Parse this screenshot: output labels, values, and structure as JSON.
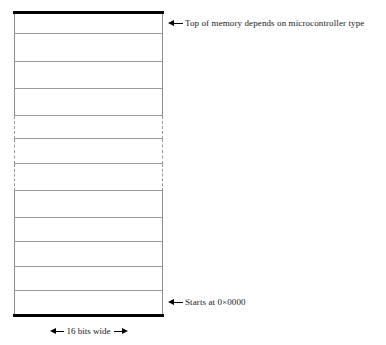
{
  "diagram": {
    "kind": "memory-map",
    "title_visible": false,
    "box": {
      "left_px": 14,
      "top_px": 11,
      "width_px": 149,
      "height_px": 306,
      "top_cap_color": "#000000",
      "bottom_cap_color": "#000000",
      "cell_rule_color": "#9a9a9a",
      "side_border_color": "#8c8c8c",
      "dashed_border_color": "#9a9a9a",
      "fill_color": "#ffffff"
    },
    "cells": [
      {
        "index": 0,
        "top_px": 0,
        "height_px": 20,
        "style": "solid",
        "rule_below": true,
        "label": ""
      },
      {
        "index": 1,
        "top_px": 20,
        "height_px": 28,
        "style": "solid",
        "rule_below": true,
        "label": ""
      },
      {
        "index": 2,
        "top_px": 48,
        "height_px": 27,
        "style": "solid",
        "rule_below": true,
        "label": ""
      },
      {
        "index": 3,
        "top_px": 75,
        "height_px": 27,
        "style": "solid",
        "rule_below": true,
        "label": ""
      },
      {
        "index": 4,
        "top_px": 102,
        "height_px": 23,
        "style": "dashed",
        "rule_below": true,
        "label": ""
      },
      {
        "index": 5,
        "top_px": 125,
        "height_px": 25,
        "style": "dashed",
        "rule_below": true,
        "label": ""
      },
      {
        "index": 6,
        "top_px": 150,
        "height_px": 27,
        "style": "dashed",
        "rule_below": true,
        "label": ""
      },
      {
        "index": 7,
        "top_px": 177,
        "height_px": 27,
        "style": "solid",
        "rule_below": true,
        "label": ""
      },
      {
        "index": 8,
        "top_px": 204,
        "height_px": 24,
        "style": "solid",
        "rule_below": true,
        "label": ""
      },
      {
        "index": 9,
        "top_px": 228,
        "height_px": 25,
        "style": "solid",
        "rule_below": true,
        "label": ""
      },
      {
        "index": 10,
        "top_px": 253,
        "height_px": 24,
        "style": "solid",
        "rule_below": true,
        "label": ""
      },
      {
        "index": 11,
        "top_px": 277,
        "height_px": 23,
        "style": "solid",
        "rule_below": false,
        "label": ""
      }
    ]
  },
  "annotations": {
    "top": {
      "text": "Top of memory depends on microcontroller type",
      "arrow_icon": "arrow-left-icon",
      "points_to": "top-of-memory"
    },
    "bottom": {
      "text": "Starts at 0×0000",
      "arrow_icon": "arrow-left-icon",
      "points_to": "bottom-of-memory"
    }
  },
  "width_dimension": {
    "label": "16 bits wide",
    "left_arrow_icon": "arrow-head-left-icon",
    "right_arrow_icon": "arrow-head-right-icon"
  }
}
